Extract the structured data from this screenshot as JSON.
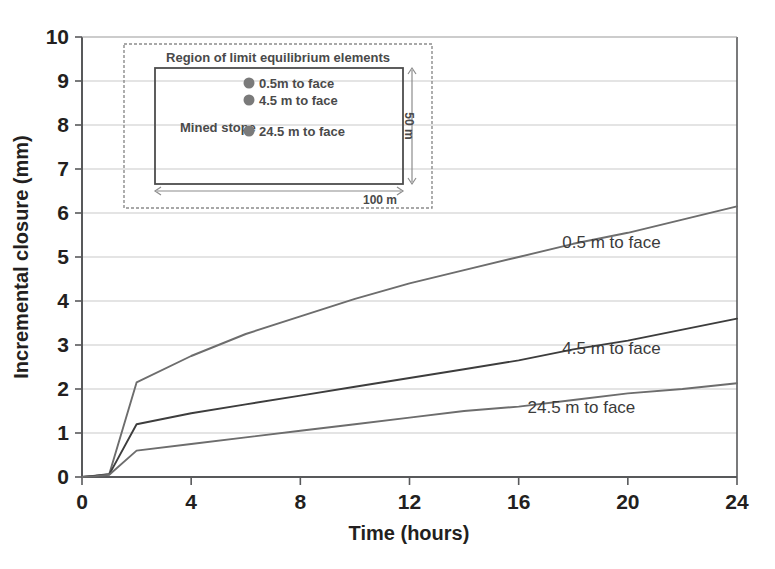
{
  "chart_data": {
    "type": "line",
    "title": "",
    "xlabel": "Time (hours)",
    "ylabel": "Incremental closure (mm)",
    "xlim": [
      0,
      24
    ],
    "ylim": [
      0,
      10
    ],
    "xticks": [
      "0",
      "4",
      "8",
      "12",
      "16",
      "20",
      "24"
    ],
    "yticks": [
      "0",
      "1",
      "2",
      "3",
      "4",
      "5",
      "6",
      "7",
      "8",
      "9",
      "10"
    ],
    "grid": "horizontal",
    "legend_position": "inline-right-of-curves",
    "x": [
      0,
      0.5,
      1,
      2,
      4,
      6,
      8,
      10,
      12,
      14,
      16,
      18,
      20,
      22,
      24
    ],
    "series": [
      {
        "name": "0.5 m to face",
        "label": "0.5 m to face",
        "color": "#6d6d6d",
        "values": [
          0,
          0.03,
          0.07,
          2.15,
          2.75,
          3.25,
          3.65,
          4.05,
          4.4,
          4.7,
          5.0,
          5.3,
          5.55,
          5.85,
          6.15
        ]
      },
      {
        "name": "4.5 m to face",
        "label": "4.5 m to face",
        "color": "#3d3d3d",
        "values": [
          0,
          0.03,
          0.06,
          1.2,
          1.45,
          1.65,
          1.85,
          2.05,
          2.25,
          2.45,
          2.65,
          2.9,
          3.1,
          3.35,
          3.6
        ]
      },
      {
        "name": "24.5 m to face",
        "label": "24.5 m to face",
        "color": "#6d6d6d",
        "values": [
          0,
          0.02,
          0.05,
          0.6,
          0.75,
          0.9,
          1.05,
          1.2,
          1.35,
          1.5,
          1.6,
          1.75,
          1.9,
          2.0,
          2.13
        ]
      }
    ],
    "annotations": [
      {
        "text": "0.5 m to face",
        "x": 19.4,
        "y": 5.2
      },
      {
        "text": "4.5 m to face",
        "x": 19.4,
        "y": 2.8
      },
      {
        "text": "24.5 m to face",
        "x": 18.3,
        "y": 1.45
      }
    ]
  },
  "inset": {
    "outer_label": "Region of limit equilibrium elements",
    "stope_label": "Mined stope",
    "markers": [
      {
        "label": "0.5m to face"
      },
      {
        "label": "4.5 m to face"
      },
      {
        "label": "24.5 m to face"
      }
    ],
    "dim_width": "100 m",
    "dim_height": "50 m",
    "marker_color": "#7a7a7a"
  },
  "style": {
    "axis_color": "#58595b",
    "grid_color": "#c9c9c9",
    "text_color": "#231f20"
  }
}
